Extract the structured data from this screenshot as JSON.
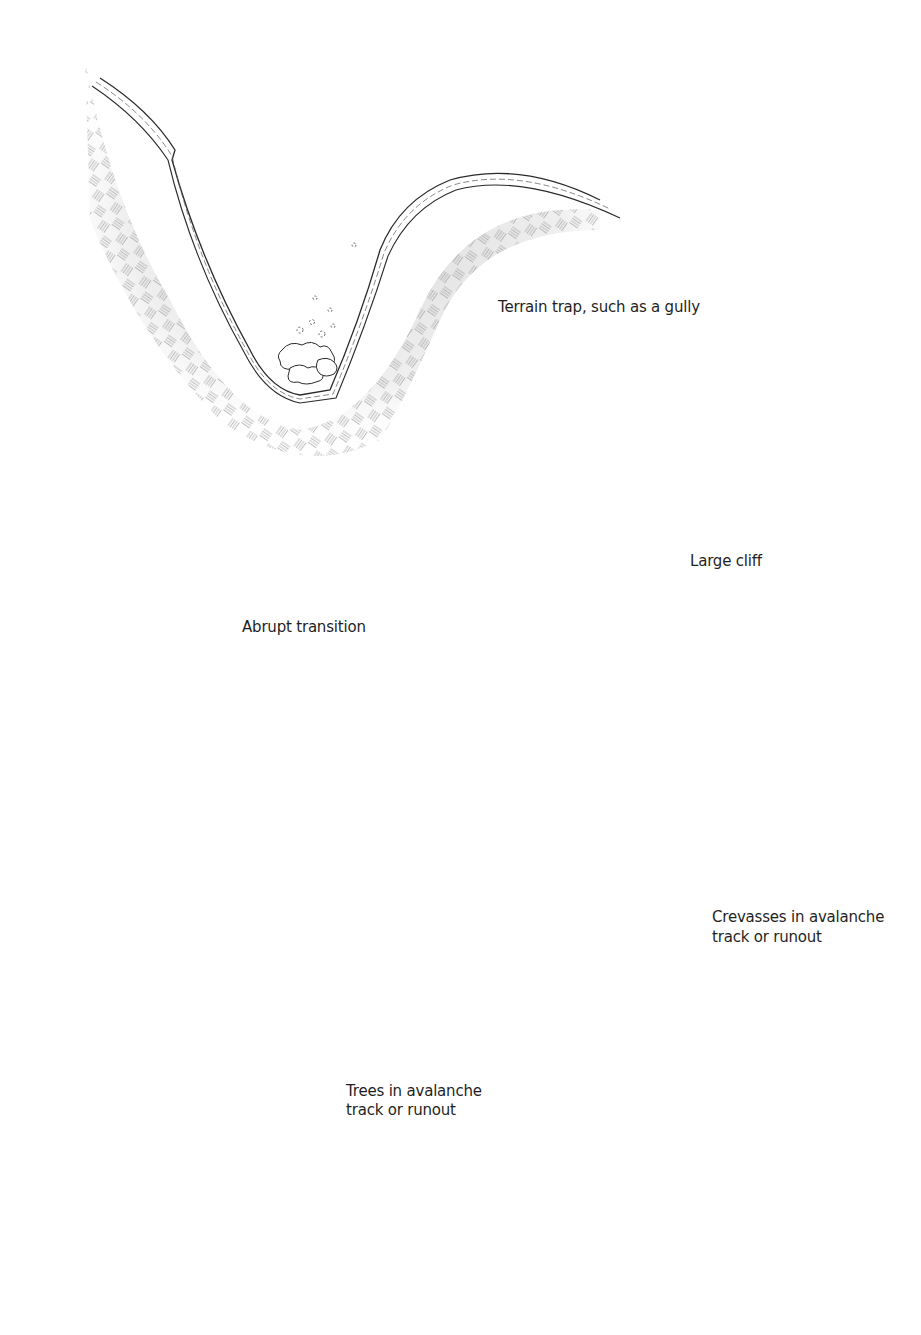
{
  "diagram": {
    "type": "illustration",
    "panels": [
      {
        "id": "gully",
        "label": "Terrain trap, such as a gully"
      },
      {
        "id": "abrupt",
        "label": "Abrupt transition"
      },
      {
        "id": "cliff",
        "label": "Large cliff"
      },
      {
        "id": "trees",
        "label_line1": "Trees in avalanche",
        "label_line2": "track or runout"
      },
      {
        "id": "crevasses",
        "label_line1": "Crevasses in avalanche",
        "label_line2": "track or runout"
      }
    ],
    "colors": {
      "background": "#ffffff",
      "ink": "#1f1f1f",
      "hatch": "#9a9a9a",
      "shade": "#d9d9d9",
      "tree": "#111111"
    }
  }
}
